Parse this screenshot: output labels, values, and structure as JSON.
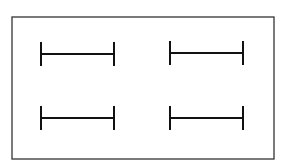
{
  "diagram": {
    "frame": {
      "x": 12,
      "y": 17,
      "width": 262,
      "height": 142,
      "stroke": "#333333"
    },
    "stroke_color": "#111111",
    "bars": [
      {
        "id": "top-left",
        "x1": 41,
        "x2": 114,
        "y": 54,
        "tick_half": 12
      },
      {
        "id": "top-right",
        "x1": 170,
        "x2": 243,
        "y": 53,
        "tick_half": 12
      },
      {
        "id": "bottom-left",
        "x1": 41,
        "x2": 114,
        "y": 118,
        "tick_half": 12
      },
      {
        "id": "bottom-right",
        "x1": 170,
        "x2": 243,
        "y": 118,
        "tick_half": 12
      }
    ]
  }
}
